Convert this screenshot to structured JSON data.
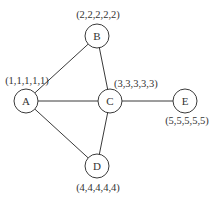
{
  "diagram": {
    "type": "undirected-graph",
    "nodes": [
      {
        "id": "A",
        "label": "A",
        "x": 26,
        "y": 101,
        "r": 12,
        "coords": "(1,1,1,1,1)",
        "coords_x": 27,
        "coords_y": 84,
        "coords_anchor": "middle"
      },
      {
        "id": "B",
        "label": "B",
        "x": 97,
        "y": 36,
        "r": 12,
        "coords": "(2,2,2,2,2)",
        "coords_x": 98,
        "coords_y": 18,
        "coords_anchor": "middle"
      },
      {
        "id": "C",
        "label": "C",
        "x": 110,
        "y": 101,
        "r": 12,
        "coords": "(3,3,3,3,3)",
        "coords_x": 114,
        "coords_y": 87,
        "coords_anchor": "start"
      },
      {
        "id": "D",
        "label": "D",
        "x": 97,
        "y": 166,
        "r": 12,
        "coords": "(4,4,4,4,4)",
        "coords_x": 98,
        "coords_y": 191,
        "coords_anchor": "middle"
      },
      {
        "id": "E",
        "label": "E",
        "x": 185,
        "y": 101,
        "r": 12,
        "coords": "(5,5,5,5,5)",
        "coords_x": 187,
        "coords_y": 124,
        "coords_anchor": "middle"
      }
    ],
    "edges": [
      {
        "from": "A",
        "to": "B"
      },
      {
        "from": "A",
        "to": "C"
      },
      {
        "from": "A",
        "to": "D"
      },
      {
        "from": "B",
        "to": "C"
      },
      {
        "from": "C",
        "to": "D"
      },
      {
        "from": "C",
        "to": "E"
      }
    ]
  }
}
